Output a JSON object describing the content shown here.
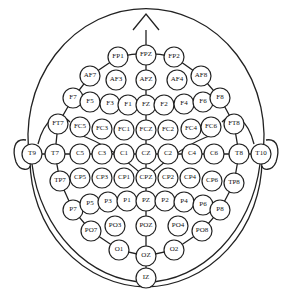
{
  "colors": {
    "stroke": "#222222",
    "background": "#ffffff"
  },
  "head": {
    "cx": 146,
    "cy": 155,
    "r": 122,
    "nose_tip_y": 14
  },
  "inner_ring": {
    "cx": 146,
    "cy": 155,
    "rx": 91,
    "ry": 100
  },
  "electrode_radius": 10,
  "electrodes": [
    {
      "label": "FP1",
      "x": 118,
      "y": 57
    },
    {
      "label": "FPZ",
      "x": 146,
      "y": 55
    },
    {
      "label": "FP2",
      "x": 174,
      "y": 57
    },
    {
      "label": "AF7",
      "x": 90,
      "y": 76
    },
    {
      "label": "AF3",
      "x": 116,
      "y": 80
    },
    {
      "label": "AFZ",
      "x": 146,
      "y": 80
    },
    {
      "label": "AF4",
      "x": 177,
      "y": 80
    },
    {
      "label": "AF8",
      "x": 201,
      "y": 76
    },
    {
      "label": "F7",
      "x": 73,
      "y": 98
    },
    {
      "label": "F5",
      "x": 90,
      "y": 102
    },
    {
      "label": "F3",
      "x": 110,
      "y": 104
    },
    {
      "label": "F1",
      "x": 128,
      "y": 105
    },
    {
      "label": "FZ",
      "x": 146,
      "y": 105
    },
    {
      "label": "F2",
      "x": 164,
      "y": 105
    },
    {
      "label": "F4",
      "x": 184,
      "y": 104
    },
    {
      "label": "F6",
      "x": 203,
      "y": 102
    },
    {
      "label": "F8",
      "x": 220,
      "y": 98
    },
    {
      "label": "FT7",
      "x": 58,
      "y": 124
    },
    {
      "label": "FC5",
      "x": 80,
      "y": 127
    },
    {
      "label": "FC3",
      "x": 102,
      "y": 129
    },
    {
      "label": "FC1",
      "x": 124,
      "y": 130
    },
    {
      "label": "FCZ",
      "x": 146,
      "y": 130
    },
    {
      "label": "FC2",
      "x": 168,
      "y": 130
    },
    {
      "label": "FC4",
      "x": 191,
      "y": 129
    },
    {
      "label": "FC6",
      "x": 211,
      "y": 127
    },
    {
      "label": "FT8",
      "x": 234,
      "y": 124
    },
    {
      "label": "T9",
      "x": 32,
      "y": 154
    },
    {
      "label": "T7",
      "x": 55,
      "y": 154
    },
    {
      "label": "C5",
      "x": 80,
      "y": 154
    },
    {
      "label": "C3",
      "x": 102,
      "y": 154
    },
    {
      "label": "C1",
      "x": 124,
      "y": 154
    },
    {
      "label": "CZ",
      "x": 146,
      "y": 154
    },
    {
      "label": "C2",
      "x": 168,
      "y": 154
    },
    {
      "label": "C4",
      "x": 192,
      "y": 154
    },
    {
      "label": "C6",
      "x": 214,
      "y": 154
    },
    {
      "label": "T8",
      "x": 239,
      "y": 154
    },
    {
      "label": "T10",
      "x": 261,
      "y": 154
    },
    {
      "label": "TP7",
      "x": 60,
      "y": 181
    },
    {
      "label": "CP5",
      "x": 80,
      "y": 178
    },
    {
      "label": "CP3",
      "x": 102,
      "y": 178
    },
    {
      "label": "CP1",
      "x": 124,
      "y": 178
    },
    {
      "label": "CPZ",
      "x": 146,
      "y": 178
    },
    {
      "label": "CP2",
      "x": 168,
      "y": 178
    },
    {
      "label": "CP4",
      "x": 190,
      "y": 178
    },
    {
      "label": "CP6",
      "x": 212,
      "y": 181
    },
    {
      "label": "TP8",
      "x": 234,
      "y": 183
    },
    {
      "label": "P7",
      "x": 73,
      "y": 210
    },
    {
      "label": "P5",
      "x": 90,
      "y": 204
    },
    {
      "label": "P3",
      "x": 108,
      "y": 202
    },
    {
      "label": "P1",
      "x": 127,
      "y": 201
    },
    {
      "label": "PZ",
      "x": 146,
      "y": 201
    },
    {
      "label": "P2",
      "x": 165,
      "y": 201
    },
    {
      "label": "P4",
      "x": 184,
      "y": 202
    },
    {
      "label": "P6",
      "x": 203,
      "y": 205
    },
    {
      "label": "P8",
      "x": 220,
      "y": 210
    },
    {
      "label": "PO7",
      "x": 91,
      "y": 231
    },
    {
      "label": "PO3",
      "x": 115,
      "y": 226
    },
    {
      "label": "POZ",
      "x": 146,
      "y": 226
    },
    {
      "label": "PO4",
      "x": 178,
      "y": 226
    },
    {
      "label": "PO8",
      "x": 202,
      "y": 231
    },
    {
      "label": "O1",
      "x": 119,
      "y": 250
    },
    {
      "label": "OZ",
      "x": 146,
      "y": 256
    },
    {
      "label": "O2",
      "x": 174,
      "y": 250
    },
    {
      "label": "IZ",
      "x": 146,
      "y": 278
    }
  ]
}
